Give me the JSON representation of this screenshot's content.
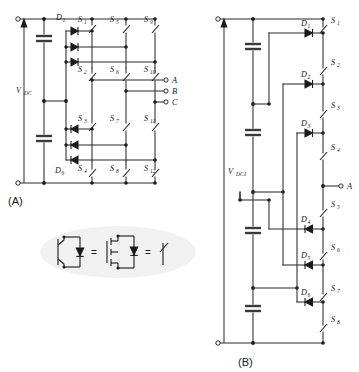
{
  "figure": {
    "panels": [
      {
        "id": "panel-a",
        "label": "(A)",
        "x": 8,
        "y": 196
      },
      {
        "id": "panel-b",
        "label": "(B)",
        "x": 238,
        "y": 358
      }
    ]
  },
  "panel_a": {
    "name": "Three-phase diode-clamped (NPC) inverter",
    "source_label": "V",
    "source_sub": "DC",
    "switches": [
      {
        "name": "S",
        "sub": "1",
        "x": 78,
        "y": 19
      },
      {
        "name": "S",
        "sub": "5",
        "x": 110,
        "y": 19
      },
      {
        "name": "S",
        "sub": "9",
        "x": 144,
        "y": 19
      },
      {
        "name": "S",
        "sub": "2",
        "x": 78,
        "y": 74
      },
      {
        "name": "S",
        "sub": "6",
        "x": 110,
        "y": 74
      },
      {
        "name": "S",
        "sub": "10",
        "x": 144,
        "y": 74
      },
      {
        "name": "S",
        "sub": "3",
        "x": 78,
        "y": 117
      },
      {
        "name": "S",
        "sub": "7",
        "x": 110,
        "y": 117
      },
      {
        "name": "S",
        "sub": "11",
        "x": 144,
        "y": 117
      },
      {
        "name": "S",
        "sub": "4",
        "x": 78,
        "y": 167
      },
      {
        "name": "S",
        "sub": "8",
        "x": 110,
        "y": 167
      },
      {
        "name": "S",
        "sub": "12",
        "x": 144,
        "y": 167
      }
    ],
    "diodes": [
      {
        "name": "D",
        "sub": "1",
        "x": 56,
        "y": 16
      },
      {
        "name": "D",
        "sub": "6",
        "x": 55,
        "y": 170
      }
    ],
    "outputs": [
      {
        "label": "A",
        "x": 169,
        "y": 80
      },
      {
        "label": "B",
        "x": 169,
        "y": 91
      },
      {
        "label": "C",
        "x": 169,
        "y": 102
      }
    ],
    "capacitor_count": 2
  },
  "panel_b": {
    "name": "Single-phase diode-clamped multilevel inverter",
    "source_label": "V",
    "source_sub": "DC1",
    "switches": [
      {
        "name": "S",
        "sub": "1",
        "x": 330,
        "y": 19
      },
      {
        "name": "S",
        "sub": "2",
        "x": 330,
        "y": 61
      },
      {
        "name": "S",
        "sub": "3",
        "x": 330,
        "y": 104
      },
      {
        "name": "S",
        "sub": "4",
        "x": 330,
        "y": 145
      },
      {
        "name": "S",
        "sub": "5",
        "x": 330,
        "y": 203
      },
      {
        "name": "S",
        "sub": "6",
        "x": 330,
        "y": 246
      },
      {
        "name": "S",
        "sub": "7",
        "x": 330,
        "y": 288
      },
      {
        "name": "S",
        "sub": "8",
        "x": 330,
        "y": 318
      }
    ],
    "diodes": [
      {
        "name": "D",
        "sub": "1",
        "x": 300,
        "y": 14
      },
      {
        "name": "D",
        "sub": "2",
        "x": 300,
        "y": 72
      },
      {
        "name": "D",
        "sub": "3",
        "x": 300,
        "y": 120
      },
      {
        "name": "D",
        "sub": "4",
        "x": 300,
        "y": 218
      },
      {
        "name": "D",
        "sub": "5",
        "x": 300,
        "y": 258
      },
      {
        "name": "D",
        "sub": "6",
        "x": 300,
        "y": 295
      }
    ],
    "outputs": [
      {
        "label": "A",
        "x": 345,
        "y": 186
      }
    ],
    "capacitor_count": 4
  },
  "legend": {
    "name": "switch-equivalence-legend",
    "equals_signs": [
      "=",
      "="
    ],
    "symbols": [
      "igbt-with-antiparallel-diode",
      "mosfet-with-antiparallel-diode",
      "ideal-switch"
    ]
  },
  "colors": {
    "wire": "#2b2b2b",
    "device": "#1a1a1a",
    "capacitor": "#3a3a3a",
    "legend_bg": "#eeeeee",
    "background": "#ffffff"
  }
}
